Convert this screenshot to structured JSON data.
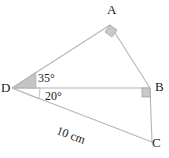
{
  "diagram": {
    "type": "geometry-figure",
    "canvas": {
      "width": 169,
      "height": 158,
      "background": "#ffffff"
    },
    "colors": {
      "line": "#b6b6b6",
      "marker_fill": "#c9c9c9",
      "marker_stroke": "#9a9a9a",
      "angle_fill": "#c4c4c4",
      "text": "#1a1a1a"
    },
    "vertices": [
      {
        "id": "A",
        "label": "A",
        "x": 110,
        "y": 25
      },
      {
        "id": "B",
        "label": "B",
        "x": 150,
        "y": 88
      },
      {
        "id": "C",
        "label": "C",
        "x": 152,
        "y": 142
      },
      {
        "id": "D",
        "label": "D",
        "x": 12,
        "y": 88
      }
    ],
    "edges": [
      {
        "from": "D",
        "to": "A"
      },
      {
        "from": "A",
        "to": "B"
      },
      {
        "from": "D",
        "to": "B"
      },
      {
        "from": "D",
        "to": "C"
      },
      {
        "from": "B",
        "to": "C"
      }
    ],
    "angles": [
      {
        "id": "angle-ADB",
        "vertex": "D",
        "label": "35°",
        "value": 35,
        "unit": "degree",
        "marked": true
      },
      {
        "id": "angle-BDC",
        "vertex": "D",
        "label": "20°",
        "value": 20,
        "unit": "degree",
        "marked": true
      },
      {
        "id": "angle-DAB",
        "vertex": "A",
        "label": "",
        "value": 90,
        "unit": "degree",
        "marked": true,
        "marker": "right-angle"
      },
      {
        "id": "angle-DBC",
        "vertex": "B",
        "label": "",
        "value": 90,
        "unit": "degree",
        "marked": true,
        "marker": "right-angle"
      }
    ],
    "measurements": [
      {
        "id": "side-DC",
        "edge": "DC",
        "label": "10 cm",
        "value": 10,
        "unit": "cm",
        "rotation_deg": 20
      }
    ]
  }
}
